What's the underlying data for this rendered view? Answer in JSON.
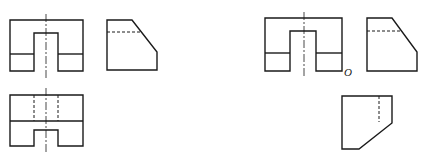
{
  "figure": {
    "type": "orthographic-projection-views",
    "left_group": {
      "front_view": {
        "outer": [
          10,
          20,
          83,
          71
        ],
        "slot": [
          34,
          33,
          58,
          71
        ],
        "split_y": 54,
        "centerline_x": 46
      },
      "side_view": {
        "points": "107,20 132,20 157,52 157,70 107,70",
        "hidden_y": 32,
        "hidden_x2": 141
      },
      "top_view": {
        "outer": [
          10,
          95,
          83,
          146
        ],
        "split_y": 121,
        "notch": [
          34,
          130,
          58,
          146
        ],
        "hidden_x": [
          34,
          58
        ],
        "centerline_x": 46
      }
    },
    "right_group": {
      "front_view": {
        "outer": [
          265,
          18,
          342,
          71
        ],
        "slot": [
          290,
          31,
          316,
          71
        ],
        "split_y": 53,
        "centerline_x": 304
      },
      "side_view": {
        "points": "367,18 392,18 417,52 417,71 367,71",
        "hidden_y": 31,
        "hidden_x2": 400
      },
      "bottom_view": {
        "points": "342,96 392,96 392,123 359,149 342,149",
        "hidden_x": 379
      }
    },
    "labels": {
      "origin": "O"
    }
  }
}
